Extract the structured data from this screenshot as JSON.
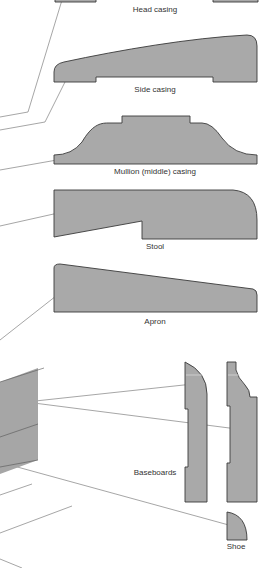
{
  "diagram": {
    "fill_color": "#a9a9a9",
    "outline_color": "#3a3a3a",
    "label_color": "#333333",
    "labels": {
      "head_casing": "Head casing",
      "side_casing": "Side casing",
      "mullion_casing": "Mullion (middle) casing",
      "stool": "Stool",
      "apron": "Apron",
      "baseboards": "Baseboards",
      "shoe": "Shoe"
    },
    "profiles": [
      {
        "id": "head-casing",
        "label": "Head casing"
      },
      {
        "id": "side-casing",
        "label": "Side casing"
      },
      {
        "id": "mullion-casing",
        "label": "Mullion (middle) casing"
      },
      {
        "id": "stool",
        "label": "Stool"
      },
      {
        "id": "apron",
        "label": "Apron"
      },
      {
        "id": "baseboard-1",
        "label": "Baseboards"
      },
      {
        "id": "baseboard-2",
        "label": "Baseboards"
      },
      {
        "id": "shoe",
        "label": "Shoe"
      }
    ]
  }
}
